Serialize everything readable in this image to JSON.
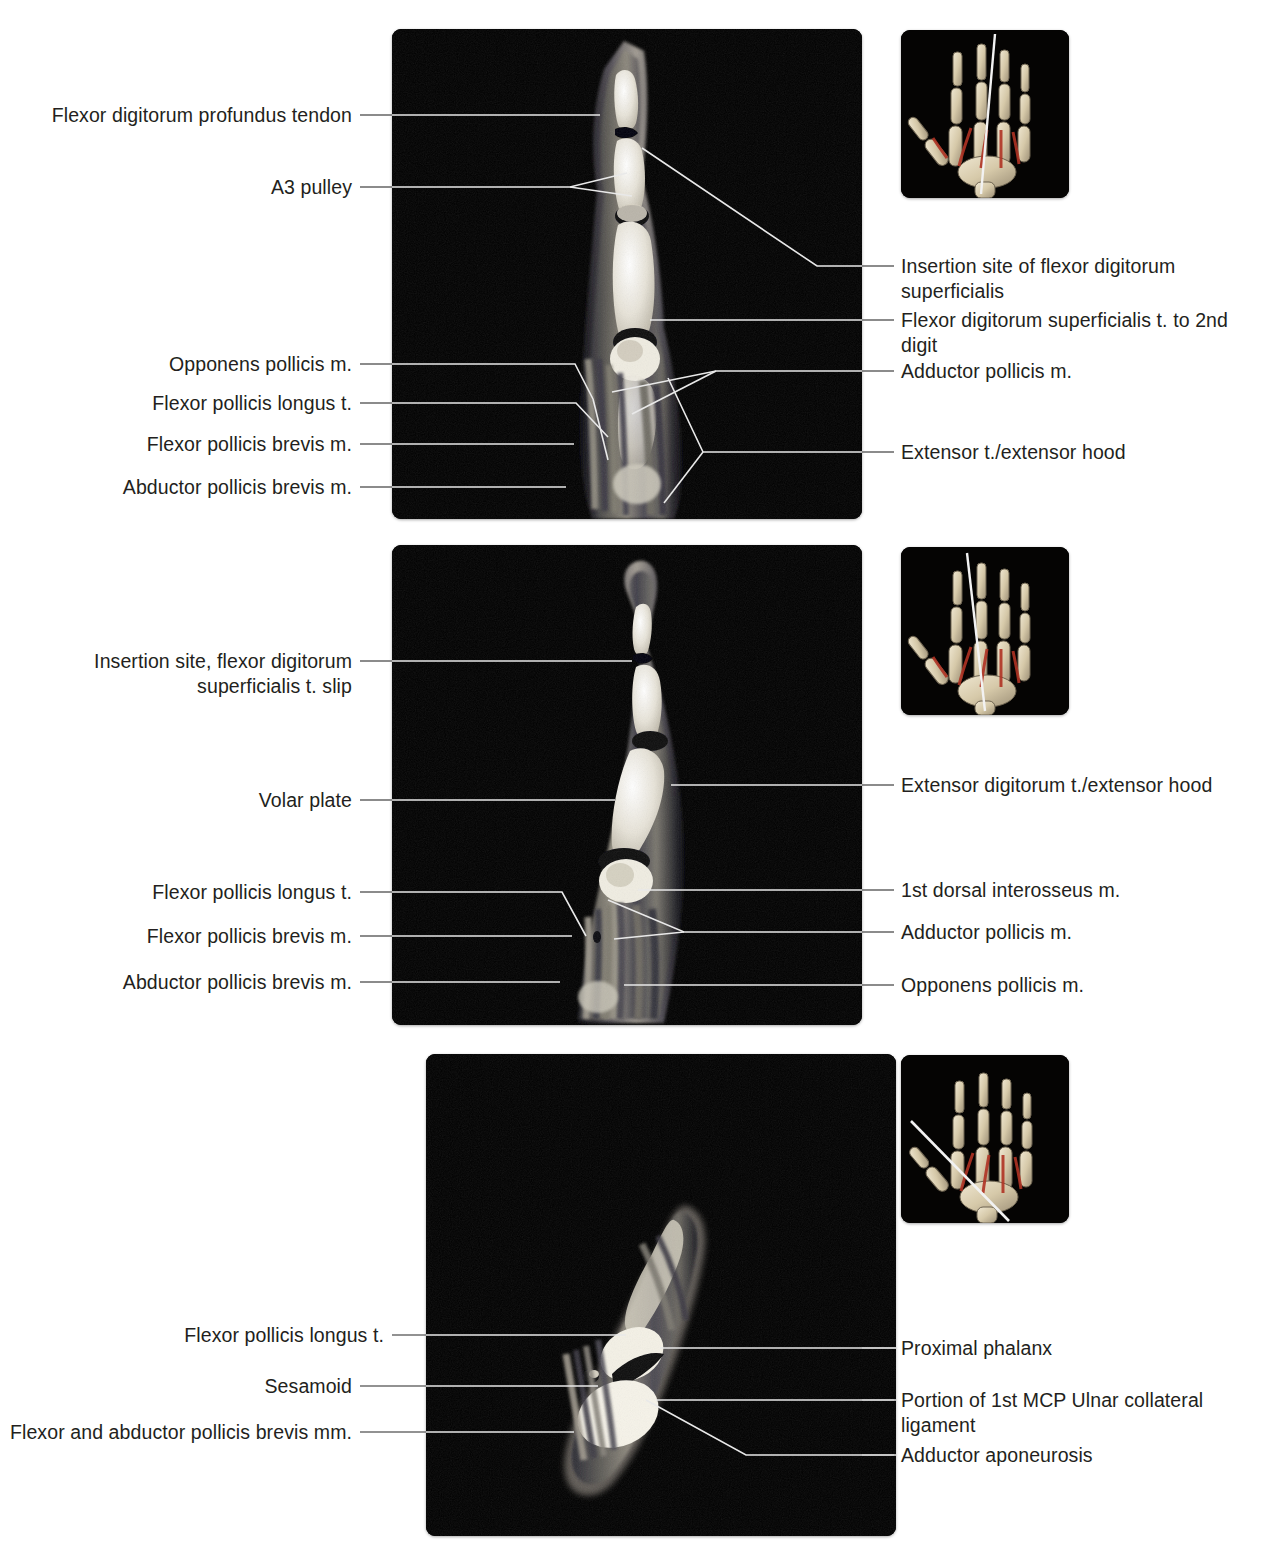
{
  "figure": {
    "type": "annotated-mri-series",
    "modality": "MRI",
    "region": "Hand / thumb - sagittal slices",
    "panel_count": 3
  },
  "panels": [
    {
      "id": "panel-1",
      "labels_left": [
        {
          "text": "Flexor digitorum profundus tendon"
        },
        {
          "text": "A3 pulley"
        },
        {
          "text": "Opponens pollicis m."
        },
        {
          "text": "Flexor pollicis longus t."
        },
        {
          "text": "Flexor pollicis brevis m."
        },
        {
          "text": "Abductor pollicis brevis m."
        }
      ],
      "labels_right": [
        {
          "text": "Insertion site of flexor digitorum superficialis"
        },
        {
          "text": "Flexor digitorum superficialis t. to 2nd digit"
        },
        {
          "text": "Adductor pollicis m."
        },
        {
          "text": "Extensor t./extensor hood"
        }
      ]
    },
    {
      "id": "panel-2",
      "labels_left": [
        {
          "text": "Insertion site, flexor digitorum superficialis t. slip"
        },
        {
          "text": "Volar plate"
        },
        {
          "text": "Flexor pollicis longus t."
        },
        {
          "text": "Flexor pollicis brevis m."
        },
        {
          "text": "Abductor pollicis brevis m."
        }
      ],
      "labels_right": [
        {
          "text": "Extensor digitorum t./extensor hood"
        },
        {
          "text": "1st dorsal interosseus m."
        },
        {
          "text": "Adductor pollicis m."
        },
        {
          "text": "Opponens pollicis m."
        }
      ]
    },
    {
      "id": "panel-3",
      "labels_left": [
        {
          "text": "Flexor pollicis longus t."
        },
        {
          "text": "Sesamoid"
        },
        {
          "text": "Flexor and abductor pollicis brevis mm."
        }
      ],
      "labels_right": [
        {
          "text": "Proximal phalanx"
        },
        {
          "text": "Portion of 1st MCP Ulnar collateral ligament"
        },
        {
          "text": "Adductor aponeurosis"
        }
      ]
    }
  ],
  "thumbnails": [
    {
      "id": "thumb-1",
      "alt": "hand-skeleton-3d-with-slice-plane"
    },
    {
      "id": "thumb-2",
      "alt": "hand-skeleton-3d-with-slice-plane"
    },
    {
      "id": "thumb-3",
      "alt": "hand-skeleton-3d-with-slice-plane"
    }
  ],
  "colors": {
    "background": "#ffffff",
    "text": "#231f20",
    "leader_line_light_bg": "#6e6e6e",
    "leader_line_dark_bg": "#e9e9e9",
    "panel_background": "#000000",
    "bone_highlight": "#f2efe6",
    "tendon_red": "#b03324"
  }
}
